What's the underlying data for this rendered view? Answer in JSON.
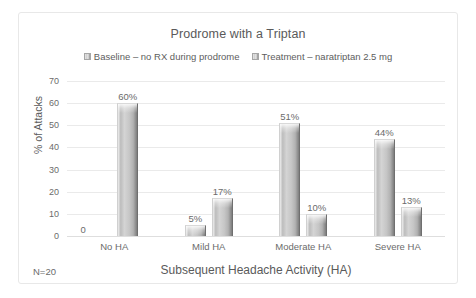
{
  "chart_data": {
    "type": "bar",
    "title": "Prodrome with a Triptan",
    "xlabel": "Subsequent Headache Activity (HA)",
    "ylabel": "% of Attacks",
    "categories": [
      "No HA",
      "Mild HA",
      "Moderate HA",
      "Severe HA"
    ],
    "series": [
      {
        "name": "Baseline – no RX during prodrome",
        "values": [
          0,
          5,
          51,
          44
        ],
        "labels": [
          "0",
          "5%",
          "51%",
          "44%"
        ]
      },
      {
        "name": "Treatment – naratriptan 2.5 mg",
        "values": [
          60,
          17,
          10,
          13
        ],
        "labels": [
          "60%",
          "17%",
          "10%",
          "13%"
        ]
      }
    ],
    "ylim": [
      0,
      70
    ],
    "yticks": [
      0,
      10,
      20,
      30,
      40,
      50,
      60,
      70
    ],
    "ytick_labels": [
      "0",
      "10",
      "20",
      "30",
      "40",
      "50",
      "60",
      "70"
    ],
    "grid": true,
    "legend_position": "top",
    "annotation": "N=20",
    "colors": {
      "bar_fill": "#c6c6c6",
      "bar_edge_dark": "#7d7d7d",
      "gridline": "#eaeaea",
      "text": "#5a5a5a",
      "border": "#e8e8e8"
    }
  }
}
